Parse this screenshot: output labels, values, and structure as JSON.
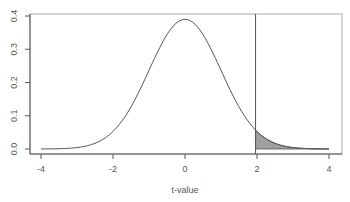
{
  "chart_data": {
    "type": "area",
    "title": "",
    "xlabel": "t-value",
    "ylabel": "",
    "xlim": [
      -4,
      4
    ],
    "ylim": [
      0,
      0.4
    ],
    "xticks": [
      -4,
      -2,
      0,
      2,
      4
    ],
    "xtick_labels": [
      "-4",
      "-2",
      "0",
      "2",
      "4"
    ],
    "yticks": [
      0.0,
      0.1,
      0.2,
      0.3,
      0.4
    ],
    "ytick_labels": [
      "0.0",
      "0.1",
      "0.2",
      "0.3",
      "0.4"
    ],
    "grid": false,
    "legend": null,
    "critical_value": 1.96,
    "shaded_region": {
      "from": 1.96,
      "to": 4,
      "label": "upper tail"
    },
    "series": [
      {
        "name": "t density",
        "x": [
          -4,
          -3.75,
          -3.5,
          -3.25,
          -3,
          -2.75,
          -2.5,
          -2.25,
          -2,
          -1.75,
          -1.5,
          -1.25,
          -1,
          -0.75,
          -0.5,
          -0.25,
          0,
          0.25,
          0.5,
          0.75,
          1,
          1.25,
          1.5,
          1.75,
          2,
          2.25,
          2.5,
          2.75,
          3,
          3.25,
          3.5,
          3.75,
          4
        ],
        "values": [
          0.0002,
          0.0005,
          0.0011,
          0.0025,
          0.0051,
          0.01,
          0.0183,
          0.0317,
          0.0523,
          0.0826,
          0.1246,
          0.1775,
          0.2368,
          0.2955,
          0.345,
          0.3784,
          0.39,
          0.3784,
          0.345,
          0.2955,
          0.2368,
          0.1775,
          0.1246,
          0.0826,
          0.0523,
          0.0317,
          0.0183,
          0.01,
          0.0051,
          0.0025,
          0.0011,
          0.0005,
          0.0002
        ]
      }
    ]
  },
  "colors": {
    "curve": "#555555",
    "axis": "#555555",
    "fill": "#a0a0a0",
    "border": "#999999"
  }
}
